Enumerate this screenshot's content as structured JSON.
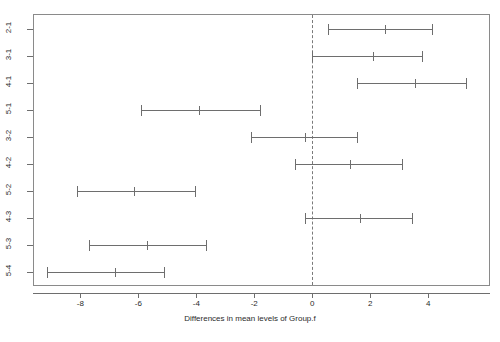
{
  "chart_data": {
    "type": "scatter",
    "subtype": "confidence-interval-dotplot",
    "title": "",
    "subtitle": "",
    "xlabel": "Differences in mean levels of Group.f",
    "ylabel": "",
    "xlim": [
      -9.6,
      6.1
    ],
    "ylim_categories_order": "top-to-bottom",
    "grid": true,
    "gridlines": "horizontal",
    "legend": null,
    "annotations": [
      {
        "kind": "reference-line",
        "orientation": "vertical",
        "value": 0,
        "style": "dashed"
      }
    ],
    "xticks": [
      -8,
      -6,
      -4,
      -2,
      0,
      2,
      4
    ],
    "xticklabels": [
      "-8",
      "-6",
      "-4",
      "-2",
      "0",
      "2",
      "4"
    ],
    "categories": [
      "2-1",
      "3-1",
      "4-1",
      "5-1",
      "3-2",
      "4-2",
      "5-2",
      "4-3",
      "5-3",
      "5-4"
    ],
    "series": [
      {
        "name": "difference",
        "values": [
          2.5,
          2.1,
          3.55,
          -3.9,
          -0.25,
          1.3,
          -6.15,
          1.65,
          -5.7,
          -6.8
        ]
      },
      {
        "name": "lower",
        "values": [
          0.55,
          0.0,
          1.55,
          -5.9,
          -2.1,
          -0.6,
          -8.1,
          -0.25,
          -7.7,
          -9.15
        ]
      },
      {
        "name": "upper",
        "values": [
          4.15,
          3.8,
          5.3,
          -1.8,
          1.55,
          3.1,
          -4.05,
          3.45,
          -3.65,
          -5.1
        ]
      }
    ],
    "points": [
      {
        "label": "2-1",
        "diff": 2.5,
        "lower": 0.55,
        "upper": 4.15
      },
      {
        "label": "3-1",
        "diff": 2.1,
        "lower": 0.0,
        "upper": 3.8
      },
      {
        "label": "4-1",
        "diff": 3.55,
        "lower": 1.55,
        "upper": 5.3
      },
      {
        "label": "5-1",
        "diff": -3.9,
        "lower": -5.9,
        "upper": -1.8
      },
      {
        "label": "3-2",
        "diff": -0.25,
        "lower": -2.1,
        "upper": 1.55
      },
      {
        "label": "4-2",
        "diff": 1.3,
        "lower": -0.6,
        "upper": 3.1
      },
      {
        "label": "5-2",
        "diff": -6.15,
        "lower": -8.1,
        "upper": -4.05
      },
      {
        "label": "4-3",
        "diff": 1.65,
        "lower": -0.25,
        "upper": 3.45
      },
      {
        "label": "5-3",
        "diff": -5.7,
        "lower": -7.7,
        "upper": -3.65
      },
      {
        "label": "5-4",
        "diff": -6.8,
        "lower": -9.15,
        "upper": -5.1
      }
    ],
    "colors": {
      "interval": "#6e6e6e",
      "frame": "#8a8a8a",
      "grid": "#f0f0f0",
      "reference_line": "#7a7a7a",
      "text": "#2b2b2b",
      "background": "#ffffff"
    }
  }
}
